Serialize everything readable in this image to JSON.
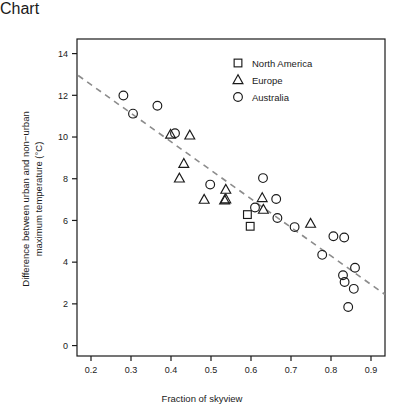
{
  "chart_data": {
    "type": "scatter",
    "title": "",
    "xlabel": "Fraction of skyview",
    "ylabel": "Difference between urban and non−urban maximum temperature (°C)",
    "ylabel_line1": "Difference between urban and non−urban",
    "ylabel_line2": "maximum temperature (°C)",
    "xlim": [
      0.165,
      0.935
    ],
    "ylim": [
      -0.5,
      14.7
    ],
    "xticks": [
      0.2,
      0.3,
      0.4,
      0.5,
      0.6,
      0.7,
      0.8,
      0.9
    ],
    "xtick_labels": [
      "0.2",
      "0.3",
      "0.4",
      "0.5",
      "0.6",
      "0.7",
      "0.8",
      "0.9"
    ],
    "yticks": [
      0,
      2,
      4,
      6,
      8,
      10,
      12,
      14
    ],
    "ytick_labels": [
      "0",
      "2",
      "4",
      "6",
      "8",
      "10",
      "12",
      "14"
    ],
    "grid": false,
    "legend_position": "top-right",
    "marker_color": "#1a1a1a",
    "trendline": {
      "style": "dashed",
      "color": "#8c8c8c",
      "x": [
        0.168,
        0.935
      ],
      "y": [
        12.95,
        2.45
      ]
    },
    "series": [
      {
        "name": "North America",
        "marker": "square",
        "points": [
          {
            "x": 0.591,
            "y": 6.28
          },
          {
            "x": 0.598,
            "y": 5.72
          }
        ]
      },
      {
        "name": "Europe",
        "marker": "triangle",
        "points": [
          {
            "x": 0.399,
            "y": 10.12
          },
          {
            "x": 0.447,
            "y": 10.08
          },
          {
            "x": 0.432,
            "y": 8.72
          },
          {
            "x": 0.421,
            "y": 8.02
          },
          {
            "x": 0.483,
            "y": 7.0
          },
          {
            "x": 0.537,
            "y": 7.48
          },
          {
            "x": 0.537,
            "y": 7.02
          },
          {
            "x": 0.534,
            "y": 6.97
          },
          {
            "x": 0.628,
            "y": 7.08
          },
          {
            "x": 0.631,
            "y": 6.52
          },
          {
            "x": 0.749,
            "y": 5.85
          }
        ]
      },
      {
        "name": "Australia",
        "marker": "circle",
        "points": [
          {
            "x": 0.281,
            "y": 11.99
          },
          {
            "x": 0.305,
            "y": 11.12
          },
          {
            "x": 0.366,
            "y": 11.5
          },
          {
            "x": 0.41,
            "y": 10.18
          },
          {
            "x": 0.498,
            "y": 7.72
          },
          {
            "x": 0.63,
            "y": 8.03
          },
          {
            "x": 0.663,
            "y": 7.03
          },
          {
            "x": 0.61,
            "y": 6.62
          },
          {
            "x": 0.666,
            "y": 6.12
          },
          {
            "x": 0.709,
            "y": 5.68
          },
          {
            "x": 0.778,
            "y": 4.35
          },
          {
            "x": 0.806,
            "y": 5.24
          },
          {
            "x": 0.833,
            "y": 5.18
          },
          {
            "x": 0.86,
            "y": 3.73
          },
          {
            "x": 0.83,
            "y": 3.37
          },
          {
            "x": 0.834,
            "y": 3.05
          },
          {
            "x": 0.857,
            "y": 2.72
          },
          {
            "x": 0.843,
            "y": 1.85
          }
        ]
      }
    ],
    "legend": [
      {
        "label": "North America",
        "marker": "square"
      },
      {
        "label": "Europe",
        "marker": "triangle"
      },
      {
        "label": "Australia",
        "marker": "circle"
      }
    ]
  }
}
